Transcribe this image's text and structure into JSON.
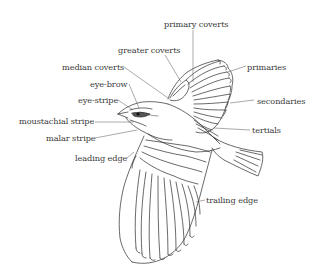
{
  "diagram": {
    "colors": {
      "ink": "#2a2a2a",
      "label": "#3a3a3a",
      "background": "#ffffff",
      "eye_patch": "#555555"
    },
    "labels": {
      "primary_coverts": "primary coverts",
      "greater_coverts": "greater coverts",
      "median_coverts": "median coverts",
      "eye_brow": "eye-brow",
      "eye_stripe": "eye-stripe",
      "moustachial_stripe": "moustachial stripe",
      "malar_stripe": "malar stripe",
      "leading_edge": "leading edge",
      "primaries": "primaries",
      "secondaries": "secondaries",
      "tertials": "tertials",
      "trailing_edge": "trailing edge"
    }
  }
}
